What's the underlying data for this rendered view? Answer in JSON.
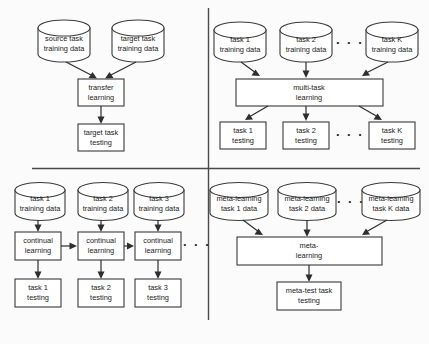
{
  "figure": {
    "background_color": "#fbfbfb",
    "stroke_color": "#3a3a3a",
    "text_color": "#1a1a1a",
    "ellipsis": "· · ·"
  },
  "quadrants": {
    "transfer_learning": {
      "name": "transfer learning",
      "sources": [
        {
          "line1": "source task",
          "line2": "training data"
        },
        {
          "line1": "target task",
          "line2": "training data"
        }
      ],
      "process": {
        "line1": "transfer",
        "line2": "learning"
      },
      "outputs": [
        {
          "line1": "target task",
          "line2": "testing"
        }
      ]
    },
    "multi_task_learning": {
      "name": "multi-task learning",
      "sources": [
        {
          "line1": "task 1",
          "line1_italic": "",
          "line2": "training data"
        },
        {
          "line1": "task 2",
          "line1_italic": "",
          "line2": "training data"
        },
        {
          "line1": "task ",
          "line1_italic": "K",
          "line2": "training data"
        }
      ],
      "source_ellipsis": "· · ·",
      "process": {
        "line1": "multi-task",
        "line2": "learning"
      },
      "outputs": [
        {
          "line1": "task 1",
          "line1_italic": "",
          "line2": "testing"
        },
        {
          "line1": "task 2",
          "line1_italic": "",
          "line2": "testing"
        },
        {
          "line1": "task ",
          "line1_italic": "K",
          "line2": "testing"
        }
      ],
      "output_ellipsis": "· · ·"
    },
    "continual_learning": {
      "name": "continual learning",
      "sources": [
        {
          "line1": "task 1",
          "line2": "training data"
        },
        {
          "line1": "task 2",
          "line2": "training data"
        },
        {
          "line1": "task 3",
          "line2": "training data"
        }
      ],
      "processes": [
        {
          "line1": "continual",
          "line2": "learning"
        },
        {
          "line1": "continual",
          "line2": "learning"
        },
        {
          "line1": "continual",
          "line2": "learning"
        }
      ],
      "process_ellipsis": "· · ·",
      "outputs": [
        {
          "line1": "task 1",
          "line2": "testing"
        },
        {
          "line1": "task 2",
          "line2": "testing"
        },
        {
          "line1": "task 3",
          "line2": "testing"
        }
      ]
    },
    "meta_learning": {
      "name": "meta-learning",
      "sources": [
        {
          "line1": "meta-learning",
          "line2": "task 1 data",
          "line2_italic": ""
        },
        {
          "line1": "meta-learning",
          "line2": "task 2 data",
          "line2_italic": ""
        },
        {
          "line1": "meta-learning",
          "line2_pre": "task ",
          "line2_italic": "K",
          "line2_post": " data"
        }
      ],
      "source_ellipsis": "· · ·",
      "process": {
        "line1": "meta-",
        "line2": "learning"
      },
      "outputs": [
        {
          "line1": "meta-test task",
          "line2": "testing"
        }
      ]
    }
  }
}
